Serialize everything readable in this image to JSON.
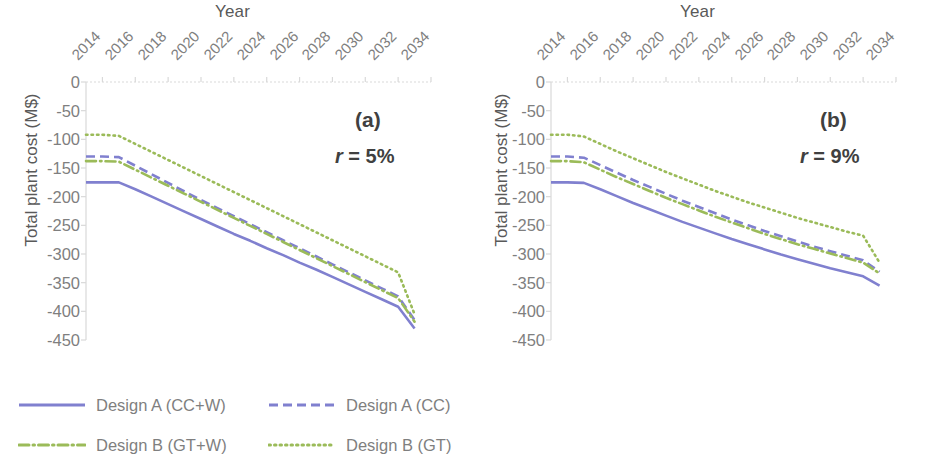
{
  "figure": {
    "axis_title_x": "Year",
    "axis_title_y": "Total plant cost (M$)"
  },
  "panels": [
    {
      "tag": "(a)",
      "rate_var": "r",
      "rate_eq": " = 5%"
    },
    {
      "tag": "(b)",
      "rate_var": "r",
      "rate_eq": " = 9%"
    }
  ],
  "legend": {
    "items": [
      {
        "label": "Design A (CC+W)",
        "style": "solid",
        "color": "#8080cf"
      },
      {
        "label": "Design A (CC)",
        "style": "dashed",
        "color": "#8080cf"
      },
      {
        "label": "Design B (GT+W)",
        "style": "dashdot",
        "color": "#9bbb59"
      },
      {
        "label": "Design B (GT)",
        "style": "dotted",
        "color": "#9bbb59"
      }
    ]
  },
  "chart_data": [
    {
      "type": "line",
      "title": "(a) r = 5%",
      "xlabel": "Year",
      "ylabel": "Total plant cost (M$)",
      "xlim": [
        2013,
        2034
      ],
      "ylim": [
        -450,
        0
      ],
      "yticks": [
        0,
        -50,
        -100,
        -150,
        -200,
        -250,
        -300,
        -350,
        -400,
        -450
      ],
      "xticks": [
        2014,
        2016,
        2018,
        2020,
        2022,
        2024,
        2026,
        2028,
        2030,
        2032,
        2034
      ],
      "grid": false,
      "legend_position": "below-figure",
      "x": [
        2013,
        2014,
        2015,
        2016,
        2017,
        2018,
        2019,
        2020,
        2021,
        2022,
        2023,
        2024,
        2025,
        2026,
        2027,
        2028,
        2029,
        2030,
        2031,
        2032,
        2033
      ],
      "series": [
        {
          "name": "Design A (CC+W)",
          "style": "solid",
          "color": "#8080cf",
          "values": [
            -175,
            -175,
            -175,
            -187,
            -200,
            -213,
            -226,
            -239,
            -252,
            -265,
            -277,
            -290,
            -302,
            -315,
            -327,
            -340,
            -353,
            -366,
            -379,
            -392,
            -430
          ]
        },
        {
          "name": "Design A (CC)",
          "style": "dashed",
          "color": "#8080cf",
          "values": [
            -130,
            -130,
            -131,
            -146,
            -161,
            -176,
            -191,
            -206,
            -220,
            -234,
            -248,
            -262,
            -276,
            -290,
            -304,
            -318,
            -332,
            -346,
            -360,
            -374,
            -415
          ]
        },
        {
          "name": "Design B (GT+W)",
          "style": "dashdot",
          "color": "#9bbb59",
          "values": [
            -138,
            -138,
            -139,
            -153,
            -167,
            -181,
            -195,
            -209,
            -223,
            -237,
            -251,
            -265,
            -279,
            -293,
            -307,
            -321,
            -335,
            -349,
            -363,
            -377,
            -418
          ]
        },
        {
          "name": "Design B (GT)",
          "style": "dotted",
          "color": "#9bbb59",
          "values": [
            -92,
            -92,
            -94,
            -108,
            -122,
            -136,
            -150,
            -164,
            -178,
            -192,
            -206,
            -220,
            -234,
            -248,
            -262,
            -276,
            -290,
            -304,
            -318,
            -332,
            -405
          ]
        }
      ]
    },
    {
      "type": "line",
      "title": "(b) r = 9%",
      "xlabel": "Year",
      "ylabel": "Total plant cost (M$)",
      "xlim": [
        2013,
        2034
      ],
      "ylim": [
        -450,
        0
      ],
      "yticks": [
        0,
        -50,
        -100,
        -150,
        -200,
        -250,
        -300,
        -350,
        -400,
        -450
      ],
      "xticks": [
        2014,
        2016,
        2018,
        2020,
        2022,
        2024,
        2026,
        2028,
        2030,
        2032,
        2034
      ],
      "grid": false,
      "legend_position": "below-figure",
      "x": [
        2013,
        2014,
        2015,
        2016,
        2017,
        2018,
        2019,
        2020,
        2021,
        2022,
        2023,
        2024,
        2025,
        2026,
        2027,
        2028,
        2029,
        2030,
        2031,
        2032,
        2033
      ],
      "series": [
        {
          "name": "Design A (CC+W)",
          "style": "solid",
          "color": "#8080cf",
          "values": [
            -175,
            -175,
            -176,
            -187,
            -199,
            -211,
            -222,
            -233,
            -244,
            -254,
            -264,
            -274,
            -283,
            -292,
            -301,
            -309,
            -317,
            -325,
            -332,
            -339,
            -355
          ]
        },
        {
          "name": "Design A (CC)",
          "style": "dashed",
          "color": "#8080cf",
          "values": [
            -130,
            -130,
            -132,
            -145,
            -158,
            -171,
            -183,
            -195,
            -207,
            -218,
            -229,
            -240,
            -250,
            -260,
            -269,
            -278,
            -287,
            -295,
            -303,
            -311,
            -331
          ]
        },
        {
          "name": "Design B (GT+W)",
          "style": "dashdot",
          "color": "#9bbb59",
          "values": [
            -138,
            -138,
            -140,
            -153,
            -166,
            -178,
            -190,
            -202,
            -213,
            -224,
            -235,
            -245,
            -255,
            -265,
            -274,
            -283,
            -291,
            -299,
            -307,
            -315,
            -334
          ]
        },
        {
          "name": "Design B (GT)",
          "style": "dotted",
          "color": "#9bbb59",
          "values": [
            -92,
            -92,
            -95,
            -108,
            -121,
            -133,
            -145,
            -157,
            -168,
            -179,
            -190,
            -200,
            -210,
            -219,
            -228,
            -237,
            -245,
            -253,
            -261,
            -268,
            -315
          ]
        }
      ]
    }
  ]
}
